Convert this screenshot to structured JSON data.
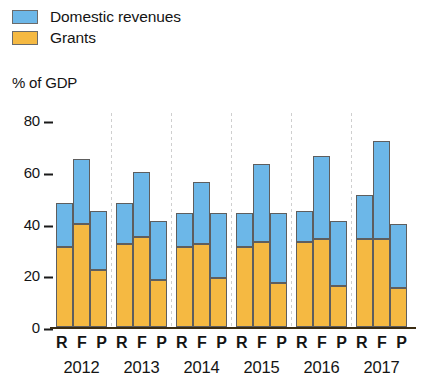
{
  "legend": {
    "items": [
      {
        "label": "Domestic revenues",
        "color": "#6CB7E8",
        "key": "domestic"
      },
      {
        "label": "Grants",
        "color": "#F5B942",
        "key": "grants"
      }
    ]
  },
  "axis": {
    "y_title": "% of GDP",
    "ticks": [
      "80",
      "60",
      "40",
      "20",
      "0"
    ]
  },
  "chart_data": {
    "type": "bar",
    "title": "",
    "subtitle": "",
    "xlabel": "",
    "ylabel": "% of GDP",
    "ylim": [
      0,
      80
    ],
    "yticks": [
      0,
      20,
      40,
      60,
      80
    ],
    "grid": false,
    "stacked": true,
    "legend_position": "top-left",
    "legend": [
      "Domestic revenues",
      "Grants"
    ],
    "colors": {
      "domestic": "#6CB7E8",
      "grants": "#F5B942"
    },
    "group_labels": [
      "2012",
      "2013",
      "2014",
      "2015",
      "2016",
      "2017"
    ],
    "subgroup_labels": [
      "R",
      "F",
      "P"
    ],
    "categories": [
      "2012 R",
      "2012 F",
      "2012 P",
      "2013 R",
      "2013 F",
      "2013 P",
      "2014 R",
      "2014 F",
      "2014 P",
      "2015 R",
      "2015 F",
      "2015 P",
      "2016 R",
      "2016 F",
      "2016 P",
      "2017 R",
      "2017 F",
      "2017 P"
    ],
    "series": [
      {
        "name": "Grants",
        "values": [
          31,
          40,
          22,
          32,
          35,
          18,
          31,
          32,
          19,
          31,
          33,
          17,
          33,
          34,
          16,
          34,
          34,
          15
        ]
      },
      {
        "name": "Domestic revenues",
        "values": [
          17,
          25,
          23,
          16,
          25,
          23,
          13,
          24,
          25,
          13,
          30,
          27,
          12,
          32,
          25,
          17,
          38,
          25
        ]
      }
    ],
    "totals": [
      48,
      65,
      45,
      48,
      60,
      41,
      44,
      56,
      44,
      44,
      63,
      44,
      45,
      66,
      41,
      51,
      72,
      40
    ],
    "groups": [
      {
        "year": "2012",
        "bars": [
          {
            "label": "R",
            "grants": 31,
            "domestic": 17,
            "total": 48
          },
          {
            "label": "F",
            "grants": 40,
            "domestic": 25,
            "total": 65
          },
          {
            "label": "P",
            "grants": 22,
            "domestic": 23,
            "total": 45
          }
        ]
      },
      {
        "year": "2013",
        "bars": [
          {
            "label": "R",
            "grants": 32,
            "domestic": 16,
            "total": 48
          },
          {
            "label": "F",
            "grants": 35,
            "domestic": 25,
            "total": 60
          },
          {
            "label": "P",
            "grants": 18,
            "domestic": 23,
            "total": 41
          }
        ]
      },
      {
        "year": "2014",
        "bars": [
          {
            "label": "R",
            "grants": 31,
            "domestic": 13,
            "total": 44
          },
          {
            "label": "F",
            "grants": 32,
            "domestic": 24,
            "total": 56
          },
          {
            "label": "P",
            "grants": 19,
            "domestic": 25,
            "total": 44
          }
        ]
      },
      {
        "year": "2015",
        "bars": [
          {
            "label": "R",
            "grants": 31,
            "domestic": 13,
            "total": 44
          },
          {
            "label": "F",
            "grants": 33,
            "domestic": 30,
            "total": 63
          },
          {
            "label": "P",
            "grants": 17,
            "domestic": 27,
            "total": 44
          }
        ]
      },
      {
        "year": "2016",
        "bars": [
          {
            "label": "R",
            "grants": 33,
            "domestic": 12,
            "total": 45
          },
          {
            "label": "F",
            "grants": 34,
            "domestic": 32,
            "total": 66
          },
          {
            "label": "P",
            "grants": 16,
            "domestic": 25,
            "total": 41
          }
        ]
      },
      {
        "year": "2017",
        "bars": [
          {
            "label": "R",
            "grants": 34,
            "domestic": 17,
            "total": 51
          },
          {
            "label": "F",
            "grants": 34,
            "domestic": 38,
            "total": 72
          },
          {
            "label": "P",
            "grants": 15,
            "domestic": 25,
            "total": 40
          }
        ]
      }
    ]
  }
}
